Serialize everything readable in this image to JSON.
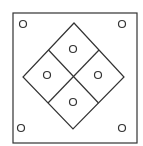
{
  "diagram": {
    "background": "#ffffff",
    "stroke_color": "#333333",
    "outer_square": {
      "x": 13,
      "y": 13,
      "width": 124,
      "height": 130
    },
    "diamond": {
      "top": [
        74,
        23
      ],
      "right": [
        124,
        77
      ],
      "bottom": [
        73,
        129
      ],
      "left": [
        23,
        77
      ],
      "center": [
        73.5,
        76.5
      ]
    },
    "corner_circles": [
      {
        "position": "top-left",
        "cx": 23,
        "cy": 24,
        "r": 3.5
      },
      {
        "position": "top-right",
        "cx": 122,
        "cy": 24,
        "r": 3.5
      },
      {
        "position": "bottom-left",
        "cx": 21,
        "cy": 128,
        "r": 3.5
      },
      {
        "position": "bottom-right",
        "cx": 122,
        "cy": 128,
        "r": 3.5
      }
    ],
    "quadrant_circles": [
      {
        "position": "top",
        "cx": 73,
        "cy": 49,
        "r": 3.5
      },
      {
        "position": "left",
        "cx": 47,
        "cy": 75,
        "r": 3.5
      },
      {
        "position": "right",
        "cx": 98,
        "cy": 75,
        "r": 3.5
      },
      {
        "position": "bottom",
        "cx": 73,
        "cy": 102,
        "r": 3.5
      }
    ]
  }
}
